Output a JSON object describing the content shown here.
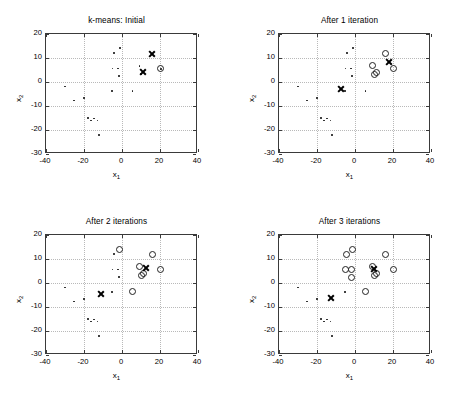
{
  "figure": {
    "width": 467,
    "height": 402,
    "background": "#ffffff",
    "marker_colors": {
      "data_point": "#1a1a1a",
      "assigned_circle": "#222222",
      "centroid_x": "#000000",
      "grid": "#b9b9b9",
      "axis": "#3a3a3a"
    }
  },
  "axis_common": {
    "xlabel": "x",
    "xlabel_sub": "1",
    "ylabel": "x",
    "ylabel_sub": "2",
    "xticks": [
      "-40",
      "-20",
      "0",
      "20",
      "40"
    ],
    "yticks": [
      "20",
      "10",
      "0",
      "-10",
      "-20",
      "-30"
    ],
    "xlim": [
      -40,
      40
    ],
    "ylim": [
      -30,
      20
    ],
    "grid": true
  },
  "chart_data": [
    {
      "type": "scatter",
      "panel": 0,
      "title": "k-means: Initial",
      "xlabel": "x_1",
      "ylabel": "x_2",
      "xlim": [
        -40,
        40
      ],
      "ylim": [
        -30,
        20
      ],
      "xticks": [
        -40,
        -20,
        0,
        20,
        40
      ],
      "yticks": [
        -30,
        -20,
        -10,
        0,
        10,
        20
      ],
      "grid": true,
      "legend": null,
      "series": [
        {
          "name": "unassigned points",
          "marker": "dot",
          "points": [
            [
              -30.0,
              -1.8
            ],
            [
              -25.2,
              -7.7
            ],
            [
              -20.0,
              -6.6
            ],
            [
              -17.8,
              -15.0
            ],
            [
              -16.3,
              -16.0
            ],
            [
              -14.8,
              -15.2
            ],
            [
              -13.0,
              -16.0
            ],
            [
              -12.2,
              -22.2
            ],
            [
              -5.2,
              -3.8
            ],
            [
              -5.0,
              5.6
            ],
            [
              -4.3,
              12.0
            ],
            [
              -2.0,
              5.6
            ],
            [
              -1.6,
              2.4
            ],
            [
              -1.2,
              14.1
            ],
            [
              5.6,
              -3.7
            ],
            [
              9.2,
              6.7
            ],
            [
              10.0,
              3.3
            ],
            [
              11.2,
              4.0
            ],
            [
              15.8,
              11.7
            ],
            [
              20.5,
              5.5
            ]
          ]
        },
        {
          "name": "cluster-1 assigned",
          "marker": "circle",
          "points": [
            [
              20.5,
              5.5
            ]
          ]
        },
        {
          "name": "centroids",
          "marker": "x",
          "points": [
            [
              15.8,
              11.7
            ],
            [
              11.2,
              4.0
            ]
          ]
        }
      ]
    },
    {
      "type": "scatter",
      "panel": 1,
      "title": "After 1 iteration",
      "xlabel": "x_1",
      "ylabel": "x_2",
      "xlim": [
        -40,
        40
      ],
      "ylim": [
        -30,
        20
      ],
      "xticks": [
        -40,
        -20,
        0,
        20,
        40
      ],
      "yticks": [
        -30,
        -20,
        -10,
        0,
        10,
        20
      ],
      "grid": true,
      "legend": null,
      "series": [
        {
          "name": "unassigned points",
          "marker": "dot",
          "points": [
            [
              -30.0,
              -1.8
            ],
            [
              -25.2,
              -7.7
            ],
            [
              -20.0,
              -6.6
            ],
            [
              -17.8,
              -15.0
            ],
            [
              -16.3,
              -16.0
            ],
            [
              -14.8,
              -15.2
            ],
            [
              -13.0,
              -16.0
            ],
            [
              -12.2,
              -22.2
            ],
            [
              -5.2,
              -3.8
            ],
            [
              -5.0,
              5.6
            ],
            [
              -4.3,
              12.0
            ],
            [
              -2.0,
              5.6
            ],
            [
              -1.6,
              2.4
            ],
            [
              -1.2,
              14.1
            ],
            [
              5.6,
              -3.7
            ]
          ]
        },
        {
          "name": "cluster assigned",
          "marker": "circle",
          "points": [
            [
              9.2,
              6.7
            ],
            [
              10.0,
              3.3
            ],
            [
              11.2,
              4.0
            ],
            [
              15.8,
              11.7
            ],
            [
              20.5,
              5.5
            ]
          ]
        },
        {
          "name": "centroids",
          "marker": "x",
          "points": [
            [
              -7.2,
              -3.1
            ],
            [
              17.8,
              8.4
            ]
          ]
        }
      ]
    },
    {
      "type": "scatter",
      "panel": 2,
      "title": "After 2 iterations",
      "xlabel": "x_1",
      "ylabel": "x_2",
      "xlim": [
        -40,
        40
      ],
      "ylim": [
        -30,
        20
      ],
      "xticks": [
        -40,
        -20,
        0,
        20,
        40
      ],
      "yticks": [
        -30,
        -20,
        -10,
        0,
        10,
        20
      ],
      "grid": true,
      "legend": null,
      "series": [
        {
          "name": "unassigned points",
          "marker": "dot",
          "points": [
            [
              -30.0,
              -1.8
            ],
            [
              -25.2,
              -7.7
            ],
            [
              -20.0,
              -6.6
            ],
            [
              -17.8,
              -15.0
            ],
            [
              -16.3,
              -16.0
            ],
            [
              -14.8,
              -15.2
            ],
            [
              -13.0,
              -16.0
            ],
            [
              -12.2,
              -22.2
            ],
            [
              -5.2,
              -3.8
            ],
            [
              -5.0,
              5.6
            ],
            [
              -4.3,
              12.0
            ],
            [
              -2.0,
              5.6
            ],
            [
              -1.6,
              2.4
            ]
          ]
        },
        {
          "name": "cluster assigned",
          "marker": "circle",
          "points": [
            [
              -1.2,
              14.1
            ],
            [
              5.6,
              -3.7
            ],
            [
              9.2,
              6.7
            ],
            [
              10.0,
              3.3
            ],
            [
              11.2,
              4.0
            ],
            [
              15.8,
              11.7
            ],
            [
              20.5,
              5.5
            ]
          ]
        },
        {
          "name": "centroids",
          "marker": "x",
          "points": [
            [
              -11.2,
              -4.5
            ],
            [
              12.6,
              6.3
            ]
          ]
        }
      ]
    },
    {
      "type": "scatter",
      "panel": 3,
      "title": "After 3 iterations",
      "xlabel": "x_1",
      "ylabel": "x_2",
      "xlim": [
        -40,
        40
      ],
      "ylim": [
        -30,
        20
      ],
      "xticks": [
        -40,
        -20,
        0,
        20,
        40
      ],
      "yticks": [
        -30,
        -20,
        -10,
        0,
        10,
        20
      ],
      "grid": true,
      "legend": null,
      "series": [
        {
          "name": "unassigned points",
          "marker": "dot",
          "points": [
            [
              -30.0,
              -1.8
            ],
            [
              -25.2,
              -7.7
            ],
            [
              -20.0,
              -6.6
            ],
            [
              -17.8,
              -15.0
            ],
            [
              -16.3,
              -16.0
            ],
            [
              -14.8,
              -15.2
            ],
            [
              -13.0,
              -16.0
            ],
            [
              -12.2,
              -22.2
            ],
            [
              -5.2,
              -3.8
            ]
          ]
        },
        {
          "name": "cluster assigned",
          "marker": "circle",
          "points": [
            [
              -5.0,
              5.6
            ],
            [
              -4.3,
              12.0
            ],
            [
              -2.0,
              5.6
            ],
            [
              -1.6,
              2.4
            ],
            [
              -1.2,
              14.1
            ],
            [
              5.6,
              -3.7
            ],
            [
              9.2,
              6.7
            ],
            [
              10.0,
              3.3
            ],
            [
              11.2,
              4.0
            ],
            [
              15.8,
              11.7
            ],
            [
              20.5,
              5.5
            ]
          ]
        },
        {
          "name": "centroids",
          "marker": "x",
          "points": [
            [
              -12.8,
              -6.3
            ],
            [
              9.8,
              6.0
            ]
          ]
        }
      ]
    }
  ]
}
